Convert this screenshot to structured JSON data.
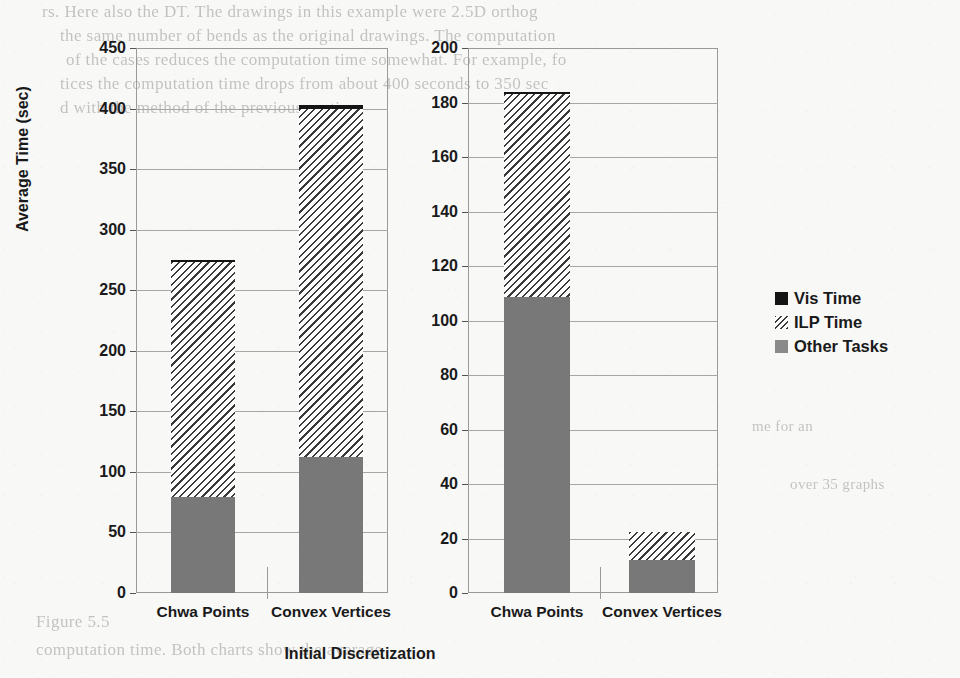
{
  "figure": {
    "xlabel": "Initial Discretization",
    "ylabel": "Average Time (sec)"
  },
  "legend": {
    "position": "right",
    "items": [
      {
        "label": "Vis Time",
        "style": "solid-black",
        "color": "#141414"
      },
      {
        "label": "ILP Time",
        "style": "diagonal-hatch",
        "color": "#3a3a3a"
      },
      {
        "label": "Other Tasks",
        "style": "solid-gray",
        "color": "#787878"
      }
    ]
  },
  "background_text": {
    "line1": "rs. Here also the DT. The drawings in this example were 2.5D orthog",
    "line2": "the same number of bends as the original drawings. The computation",
    "line3": "of the cases reduces the computation time somewhat. For example, fo",
    "line4": "tices the computation time drops from about 400 seconds to 350 sec",
    "line5": "d with the method of the previous section.",
    "line6": "Figure 5.5",
    "line7": "computation time. Both charts show the average",
    "line8": "me for an",
    "line9": "over 35 graphs"
  },
  "chart_data": [
    {
      "id": "left-chart",
      "type": "bar",
      "stacked": true,
      "title": "",
      "xlabel": "Initial Discretization",
      "ylabel": "Average Time (sec)",
      "categories": [
        "Chwa Points",
        "Convex Vertices"
      ],
      "ylim": [
        0,
        450
      ],
      "yticks": [
        0,
        50,
        100,
        150,
        200,
        250,
        300,
        350,
        400,
        450
      ],
      "grid": true,
      "series": [
        {
          "name": "Other Tasks",
          "values": [
            79,
            112
          ]
        },
        {
          "name": "ILP Time",
          "values": [
            194,
            288
          ]
        },
        {
          "name": "Vis Time",
          "values": [
            2,
            3
          ]
        }
      ],
      "totals": [
        275,
        403
      ]
    },
    {
      "id": "right-chart",
      "type": "bar",
      "stacked": true,
      "title": "",
      "xlabel": "Initial Discretization",
      "ylabel": "Average Time (sec)",
      "categories": [
        "Chwa Points",
        "Convex Vertices"
      ],
      "ylim": [
        0,
        200
      ],
      "yticks": [
        0,
        20,
        40,
        60,
        80,
        100,
        120,
        140,
        160,
        180,
        200
      ],
      "grid": true,
      "series": [
        {
          "name": "Other Tasks",
          "values": [
            108.5,
            12
          ]
        },
        {
          "name": "ILP Time",
          "values": [
            74.5,
            10.5
          ]
        },
        {
          "name": "Vis Time",
          "values": [
            1,
            0
          ]
        }
      ],
      "totals": [
        184,
        22.5
      ]
    }
  ]
}
